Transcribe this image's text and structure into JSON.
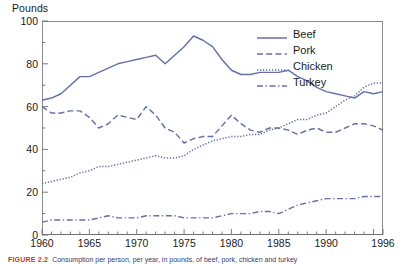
{
  "axis": {
    "ylabel": "Pounds",
    "ytick_labels": [
      "100",
      "80",
      "60",
      "40",
      "20",
      "0"
    ],
    "xtick_labels": [
      "1960",
      "1965",
      "1970",
      "1975",
      "1980",
      "1985",
      "1990",
      "1996"
    ]
  },
  "legend": {
    "items": [
      {
        "label": "Beef",
        "style": "solid"
      },
      {
        "label": "Pork",
        "style": "dashed"
      },
      {
        "label": "Chicken",
        "style": "dotted"
      },
      {
        "label": "Turkey",
        "style": "dashdot"
      }
    ]
  },
  "caption": {
    "figure_label": "FIGURE 2.2",
    "text": "Consumption per person, per year, in pounds, of beef, pork, chicken and turkey"
  },
  "colors": {
    "line": "#6670a8",
    "frame": "#8c8c8c",
    "text": "#1a1a1a",
    "caption_figure": "#c0392b",
    "caption_text": "#33406b"
  },
  "chart_data": {
    "type": "line",
    "title": "",
    "xlabel": "",
    "ylabel": "Pounds",
    "xlim": [
      1960,
      1996
    ],
    "ylim": [
      0,
      100
    ],
    "grid": false,
    "legend_position": "top-right",
    "x": [
      1960,
      1961,
      1962,
      1963,
      1964,
      1965,
      1966,
      1967,
      1968,
      1969,
      1970,
      1971,
      1972,
      1973,
      1974,
      1975,
      1976,
      1977,
      1978,
      1979,
      1980,
      1981,
      1982,
      1983,
      1984,
      1985,
      1986,
      1987,
      1988,
      1989,
      1990,
      1991,
      1992,
      1993,
      1994,
      1995,
      1996
    ],
    "series": [
      {
        "name": "Beef",
        "style": "solid",
        "values": [
          63,
          64,
          66,
          70,
          74,
          74,
          76,
          78,
          80,
          81,
          82,
          83,
          84,
          80,
          84,
          88,
          93,
          91,
          88,
          82,
          77,
          75,
          75,
          76,
          76,
          76,
          77,
          74,
          72,
          69,
          67,
          66,
          65,
          64,
          67,
          66,
          67
        ]
      },
      {
        "name": "Pork",
        "style": "dashed",
        "values": [
          60,
          57,
          57,
          58,
          58,
          55,
          50,
          52,
          56,
          55,
          54,
          60,
          56,
          50,
          48,
          43,
          45,
          46,
          46,
          51,
          56,
          52,
          49,
          48,
          50,
          50,
          49,
          47,
          49,
          50,
          48,
          48,
          50,
          52,
          52,
          51,
          49
        ]
      },
      {
        "name": "Chicken",
        "style": "dotted",
        "values": [
          24,
          25,
          26,
          27,
          29,
          30,
          32,
          32,
          33,
          34,
          35,
          36,
          37,
          36,
          36,
          37,
          40,
          42,
          44,
          45,
          46,
          46,
          47,
          47,
          49,
          50,
          52,
          54,
          54,
          56,
          57,
          60,
          63,
          65,
          69,
          71,
          71
        ]
      },
      {
        "name": "Turkey",
        "style": "dashdot",
        "values": [
          6,
          7,
          7,
          7,
          7,
          7,
          8,
          9,
          8,
          8,
          8,
          9,
          9,
          9,
          9,
          8,
          8,
          8,
          8,
          9,
          10,
          10,
          10,
          11,
          11,
          10,
          12,
          14,
          15,
          16,
          17,
          17,
          17,
          17,
          18,
          18,
          18
        ]
      }
    ]
  }
}
